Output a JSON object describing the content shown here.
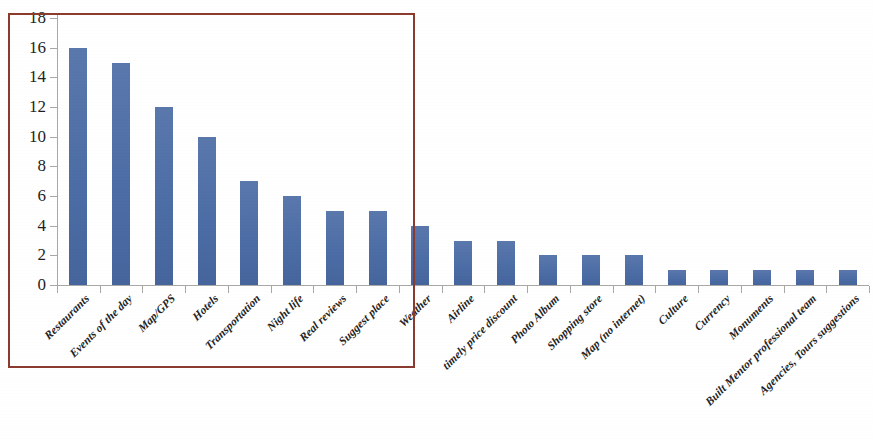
{
  "chart_data": {
    "type": "bar",
    "title": "",
    "subtitle": "",
    "xlabel": "",
    "ylabel": "",
    "ylim": [
      0,
      18
    ],
    "ytick_step": 2,
    "ytick_labels": [
      "0",
      "2",
      "4",
      "6",
      "8",
      "10",
      "12",
      "14",
      "16",
      "18"
    ],
    "grid": false,
    "legend": "none",
    "bar_color": "#4f6fa8",
    "axis_color": "#a8a8a8",
    "categories": [
      "Restaurants",
      "Events of the day",
      "Map/GPS",
      "Hotels",
      "Transportation",
      "Night life",
      "Real reviews",
      "Suggest place",
      "Weather",
      "Airline",
      "timely price discount",
      "Photo Album",
      "Shopping store",
      "Map (no internet)",
      "Culture",
      "Currency",
      "Monuments",
      "Built Mentor professional team",
      "Agencies, Tours suggestions"
    ],
    "values": [
      16,
      15,
      12,
      10,
      7,
      6,
      5,
      5,
      4,
      3,
      3,
      2,
      2,
      2,
      1,
      1,
      1,
      1,
      1
    ],
    "series": [
      {
        "name": "Count",
        "values": [
          16,
          15,
          12,
          10,
          7,
          6,
          5,
          5,
          4,
          3,
          3,
          2,
          2,
          2,
          1,
          1,
          1,
          1,
          1
        ]
      }
    ]
  },
  "annotations": {
    "highlight_rectangle": {
      "color": "#8b3a2e",
      "covers_categories": [
        "Restaurants",
        "Events of the day",
        "Map/GPS",
        "Hotels",
        "Transportation",
        "Night life",
        "Real reviews",
        "Suggest place"
      ]
    }
  }
}
